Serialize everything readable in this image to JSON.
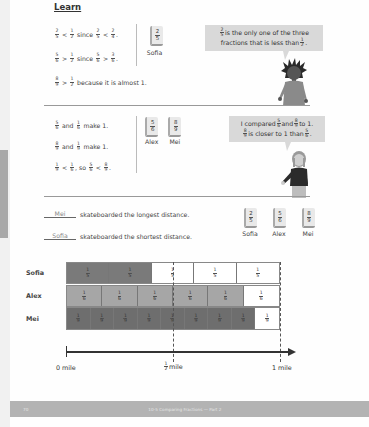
{
  "section_title": "Learn",
  "part1": {
    "lines": [
      {
        "parts": [
          {
            "f": [
              "2",
              "5"
            ]
          },
          {
            "t": " < "
          },
          {
            "f": [
              "1",
              "2"
            ]
          },
          {
            "t": " since "
          },
          {
            "f": [
              "2",
              "5"
            ]
          },
          {
            "t": " < "
          },
          {
            "f": [
              "2",
              "4"
            ]
          },
          {
            "t": "."
          }
        ]
      },
      {
        "parts": [
          {
            "f": [
              "5",
              "6"
            ]
          },
          {
            "t": " > "
          },
          {
            "f": [
              "1",
              "2"
            ]
          },
          {
            "t": " since "
          },
          {
            "f": [
              "5",
              "6"
            ]
          },
          {
            "t": " > "
          },
          {
            "f": [
              "3",
              "6"
            ]
          },
          {
            "t": "."
          }
        ]
      },
      {
        "parts": [
          {
            "f": [
              "8",
              "9"
            ]
          },
          {
            "t": " > "
          },
          {
            "f": [
              "1",
              "2"
            ]
          },
          {
            "t": " because it is almost 1."
          }
        ]
      }
    ],
    "card": {
      "num": "2",
      "den": "5",
      "label": "Sofia"
    },
    "bubble": {
      "line1_frac": [
        "2",
        "5"
      ],
      "line1_text": " is the only one of the three",
      "line2_text": "fractions that is less than ",
      "line2_frac": [
        "1",
        "2"
      ],
      "line2_end": "."
    }
  },
  "part2": {
    "lines": [
      {
        "parts": [
          {
            "f": [
              "5",
              "6"
            ]
          },
          {
            "t": " and "
          },
          {
            "f": [
              "1",
              "6"
            ]
          },
          {
            "t": " make 1."
          }
        ]
      },
      {
        "parts": [
          {
            "f": [
              "8",
              "9"
            ]
          },
          {
            "t": " and "
          },
          {
            "f": [
              "1",
              "9"
            ]
          },
          {
            "t": " make 1."
          }
        ]
      },
      {
        "parts": [
          {
            "f": [
              "1",
              "9"
            ]
          },
          {
            "t": " < "
          },
          {
            "f": [
              "1",
              "6"
            ]
          },
          {
            "t": ", so "
          },
          {
            "f": [
              "5",
              "6"
            ]
          },
          {
            "t": " < "
          },
          {
            "f": [
              "8",
              "9"
            ]
          },
          {
            "t": "."
          }
        ]
      }
    ],
    "cards": [
      {
        "num": "5",
        "den": "6",
        "label": "Alex"
      },
      {
        "num": "8",
        "den": "9",
        "label": "Mei"
      }
    ],
    "bubble": {
      "line1_text_a": "I compared ",
      "line1_frac_a": [
        "5",
        "6"
      ],
      "line1_text_b": " and ",
      "line1_frac_b": [
        "8",
        "9"
      ],
      "line1_text_c": " to 1.",
      "line2_frac": [
        "8",
        "9"
      ],
      "line2_text": " is closer to 1 than ",
      "line2_frac_b": [
        "5",
        "6"
      ],
      "line2_end": "."
    }
  },
  "answers": {
    "longest": {
      "blank": "Mei",
      "text": "skateboarded the longest distance."
    },
    "shortest": {
      "blank": "Sofia",
      "text": "skateboarded the shortest distance."
    },
    "cards": [
      {
        "num": "2",
        "den": "5",
        "label": "Sofia"
      },
      {
        "num": "5",
        "den": "6",
        "label": "Alex"
      },
      {
        "num": "8",
        "den": "9",
        "label": "Mei"
      }
    ]
  },
  "bar_model": {
    "rows": [
      {
        "label": "Sofia",
        "denominator": 5,
        "filled": 2,
        "fill_color": "#7a7a7a",
        "segment_label": [
          "1",
          "5"
        ]
      },
      {
        "label": "Alex",
        "denominator": 6,
        "filled": 5,
        "fill_color": "#a6a6a6",
        "segment_label": [
          "1",
          "6"
        ]
      },
      {
        "label": "Mei",
        "denominator": 9,
        "filled": 8,
        "fill_color": "#6e6e6e",
        "segment_label": [
          "1",
          "9"
        ]
      }
    ],
    "axis": {
      "start_label": "0 mile",
      "half_frac": [
        "1",
        "2"
      ],
      "half_text": " mile",
      "end_label": "1 mile"
    }
  },
  "footer": {
    "page_number": "70",
    "lesson": "10-5 Comparing Fractions — Part 2"
  }
}
